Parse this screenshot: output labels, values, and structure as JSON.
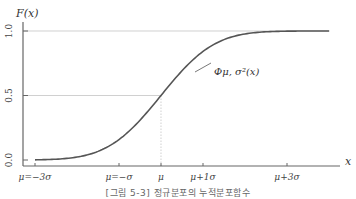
{
  "chart_data": {
    "type": "line",
    "title": "",
    "ylabel": "F(x)",
    "xlabel": "x",
    "ylim": [
      0,
      1
    ],
    "xlim_sigma": [
      -3,
      3
    ],
    "yticks": [
      {
        "value": 0.0,
        "label": "0.0"
      },
      {
        "value": 0.5,
        "label": "0.5"
      },
      {
        "value": 1.0,
        "label": "1.0"
      }
    ],
    "xticks": [
      {
        "value": -3,
        "label": "μ=−3σ"
      },
      {
        "value": -1,
        "label": "μ=−σ"
      },
      {
        "value": 0,
        "label": "μ"
      },
      {
        "value": 1,
        "label": "μ+1σ"
      },
      {
        "value": 3,
        "label": "μ+3σ"
      }
    ],
    "series": [
      {
        "name": "Φμ, σ²(x)",
        "function": "normal_cdf",
        "color": "#555555"
      }
    ],
    "annotation": "Φμ, σ²(x)",
    "reference_lines": [
      {
        "axis": "y",
        "value": 1.0
      },
      {
        "axis": "y",
        "value": 0.5,
        "x_to": 0
      },
      {
        "axis": "x",
        "value": 0,
        "y_to": 0.5
      }
    ],
    "grid": false
  },
  "caption": "[그림 5-3] 정규분포의 누적분포함수"
}
